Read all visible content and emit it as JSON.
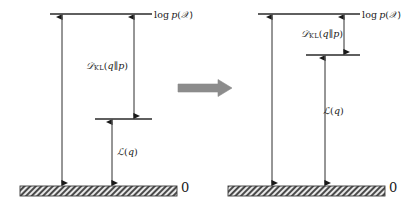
{
  "figure": {
    "type": "diagram",
    "background_color": "#ffffff",
    "ink_color": "#1a1a1a",
    "arrow_color": "#808080",
    "panels": [
      {
        "id": "left",
        "name": "before-optimization",
        "levels": {
          "log_evidence": {
            "label_html": "log&#8201;<span class=\"it\">p</span>(<span class=\"cal\">&#119987;</span>)",
            "label_text": "log p(X)",
            "y": 14,
            "x_start": 50,
            "x_end": 152
          },
          "elbo": {
            "label_text": "L(q) level",
            "y": 119,
            "x_start": 95,
            "x_end": 152
          },
          "zero": {
            "label_text": "0",
            "y": 186
          }
        },
        "gaps": {
          "kl": {
            "label_html": "<span class=\"cal\">&#119967;</span><span class=\"sub\">KL</span>(<span class=\"it\">q</span>&#8741;<span class=\"it\">p</span>)",
            "label_text": "D_KL(q||p)",
            "from_y": 14,
            "to_y": 119,
            "arrow_x": 134
          },
          "elbo": {
            "label_html": "<span class=\"cal\">&#8466;</span>(<span class=\"it\">q</span>)",
            "label_text": "L(q)",
            "from_y": 119,
            "to_y": 186,
            "arrow_x": 112
          },
          "total": {
            "label_text": "log p(X) total span",
            "from_y": 14,
            "to_y": 186,
            "arrow_x": 62
          }
        },
        "ground": {
          "x_start": 20,
          "x_end": 177,
          "y": 186,
          "height": 10,
          "zero_label": "0",
          "zero_x": 181
        }
      },
      {
        "id": "right",
        "name": "after-optimization",
        "levels": {
          "log_evidence": {
            "label_html": "log&#8201;<span class=\"it\">p</span>(<span class=\"cal\">&#119987;</span>)",
            "label_text": "log p(X)",
            "y": 14,
            "x_start": 258,
            "x_end": 360
          },
          "elbo": {
            "label_text": "L(q) level",
            "y": 55,
            "x_start": 306,
            "x_end": 360
          },
          "zero": {
            "label_text": "0",
            "y": 186
          }
        },
        "gaps": {
          "kl": {
            "label_html": "<span class=\"cal\">&#119967;</span><span class=\"sub\">KL</span>(<span class=\"it\">q</span>&#8741;<span class=\"it\">p</span>)",
            "label_text": "D_KL(q||p)",
            "from_y": 14,
            "to_y": 55,
            "arrow_x": 344
          },
          "elbo": {
            "label_html": "<span class=\"cal\">&#8466;</span>(<span class=\"it\">q</span>)",
            "label_text": "L(q)",
            "from_y": 55,
            "to_y": 186,
            "arrow_x": 325
          },
          "total": {
            "label_text": "log p(X) total span",
            "from_y": 14,
            "to_y": 186,
            "arrow_x": 272
          }
        },
        "ground": {
          "x_start": 228,
          "x_end": 385,
          "y": 186,
          "height": 10,
          "zero_label": "0",
          "zero_x": 389
        }
      }
    ],
    "transition_arrow": {
      "label_text": "optimization step arrow",
      "x_start": 178,
      "x_end": 232,
      "y": 88,
      "color": "#808080"
    },
    "labels": {
      "log_evidence_left": "log p(X)",
      "log_evidence_right": "log p(X)",
      "kl_left": "D_KL(q||p)",
      "kl_right": "D_KL(q||p)",
      "elbo_left": "L(q)",
      "elbo_right": "L(q)",
      "zero_left": "0",
      "zero_right": "0"
    }
  }
}
